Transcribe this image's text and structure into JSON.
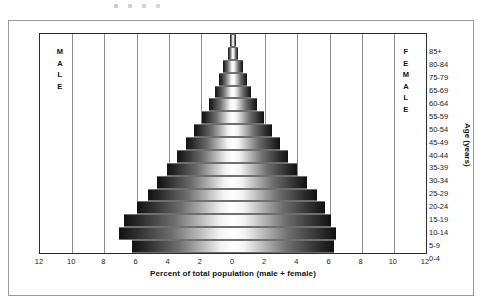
{
  "figure": {
    "axis_title_x": "Percent of total population (male + female)",
    "axis_title_y": "Age (years)",
    "caption_male": "MALE",
    "caption_female": "FEMALE"
  },
  "colors": {
    "frame": "#9a9a9a",
    "plot_border": "#2b2b2b",
    "gridline": "#8d8d8d",
    "zero_line": "#4a4a4a",
    "bar_dark": "#111111",
    "bar_light": "#ffffff",
    "text": "#1a1a1a"
  },
  "chart_data": {
    "type": "bar",
    "title": "",
    "subtitle": "",
    "orientation": "horizontal-diverging",
    "xlabel": "Percent of total population (male + female)",
    "ylabel": "Age (years)",
    "xlim": [
      -12,
      12
    ],
    "xtick_values": [
      -12,
      -10,
      -8,
      -6,
      -4,
      -2,
      0,
      2,
      4,
      6,
      8,
      10,
      12
    ],
    "xtick_labels": [
      "12",
      "10",
      "8",
      "6",
      "4",
      "2",
      "0",
      "2",
      "4",
      "6",
      "8",
      "10",
      "12"
    ],
    "grid": true,
    "grid_axis": "x",
    "legend": "inside-plot-side-captions",
    "categories": [
      "0-4",
      "5-9",
      "10-14",
      "15-19",
      "20-24",
      "25-29",
      "30-34",
      "35-39",
      "40-44",
      "45-49",
      "50-54",
      "55-59",
      "60-64",
      "65-69",
      "75-79",
      "80-84",
      "85+"
    ],
    "categories_order": "bottom-to-top",
    "series": [
      {
        "name": "MALE",
        "side": "left",
        "values": [
          6.3,
          7.1,
          6.8,
          6.0,
          5.3,
          4.7,
          4.1,
          3.5,
          2.9,
          2.4,
          1.9,
          1.5,
          1.15,
          0.85,
          0.6,
          0.3,
          0.18
        ]
      },
      {
        "name": "FEMALE",
        "side": "right",
        "values": [
          6.3,
          6.4,
          6.1,
          5.7,
          5.2,
          4.6,
          4.0,
          3.4,
          2.9,
          2.4,
          1.9,
          1.5,
          1.15,
          0.85,
          0.6,
          0.3,
          0.18
        ]
      }
    ]
  }
}
